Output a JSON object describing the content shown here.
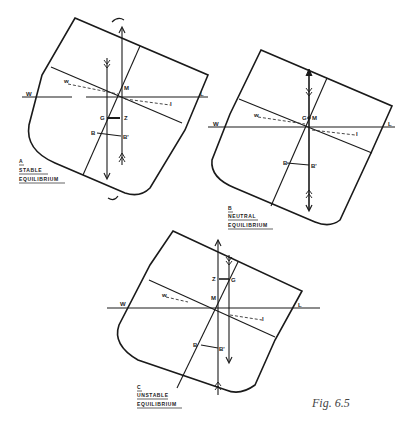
{
  "figure": {
    "caption": "Fig. 6.5"
  },
  "diagrams": [
    {
      "id": "A",
      "letter": "A",
      "title_line1": "STABLE",
      "title_line2": "EQUILIBRIUM",
      "points": {
        "M": "M",
        "G": "G",
        "Z": "Z",
        "B": "B",
        "B1": "B'",
        "W": "W",
        "L": "L",
        "w": "w",
        "l": "l"
      }
    },
    {
      "id": "B",
      "letter": "B",
      "title_line1": "NEUTRAL",
      "title_line2": "EQUILIBRIUM",
      "points": {
        "GM": "G",
        "M": "M",
        "B": "B",
        "B1": "B'",
        "W": "W",
        "L": "L",
        "w": "w",
        "l": "l"
      }
    },
    {
      "id": "C",
      "letter": "C",
      "title_line1": "UNSTABLE",
      "title_line2": "EQUILIBRIUM",
      "points": {
        "M": "M",
        "G": "G",
        "Z": "Z",
        "B": "B",
        "B1": "B'",
        "W": "W",
        "L": "L",
        "w": "w",
        "l": "l"
      }
    }
  ]
}
